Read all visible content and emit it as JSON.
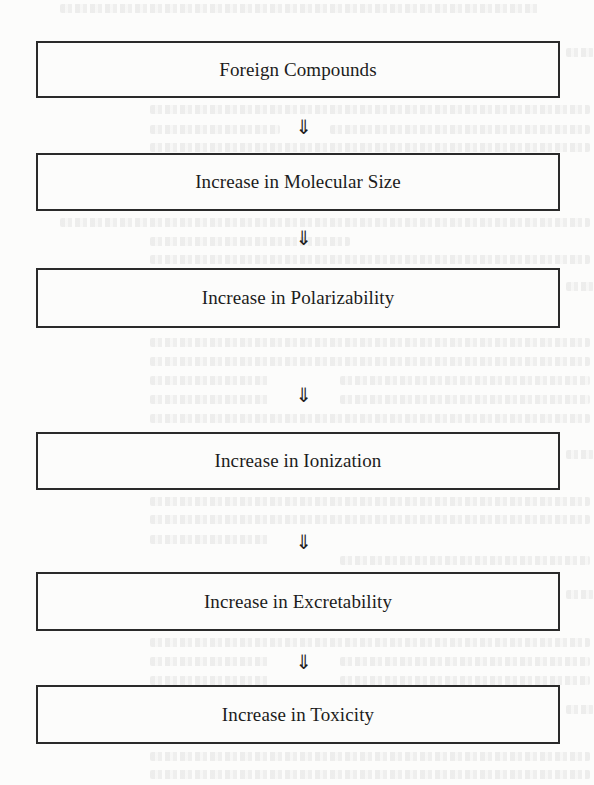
{
  "diagram": {
    "type": "vertical-flowchart",
    "arrow_glyph": "⇓",
    "nodes": [
      {
        "id": "n1",
        "label": "Foreign Compounds"
      },
      {
        "id": "n2",
        "label": "Increase in Molecular Size"
      },
      {
        "id": "n3",
        "label": "Increase in Polarizability"
      },
      {
        "id": "n4",
        "label": "Increase in Ionization"
      },
      {
        "id": "n5",
        "label": "Increase in Excretability"
      },
      {
        "id": "n6",
        "label": "Increase in Toxicity"
      }
    ],
    "edges": [
      {
        "from": "n1",
        "to": "n2",
        "label": "⇓"
      },
      {
        "from": "n2",
        "to": "n3",
        "label": "⇓"
      },
      {
        "from": "n3",
        "to": "n4",
        "label": "⇓"
      },
      {
        "from": "n4",
        "to": "n5",
        "label": "⇓"
      },
      {
        "from": "n5",
        "to": "n6",
        "label": "⇓"
      }
    ]
  },
  "colors": {
    "background": "#fcfcfb",
    "border": "#2a2a2a",
    "text": "#1c1c1c"
  }
}
